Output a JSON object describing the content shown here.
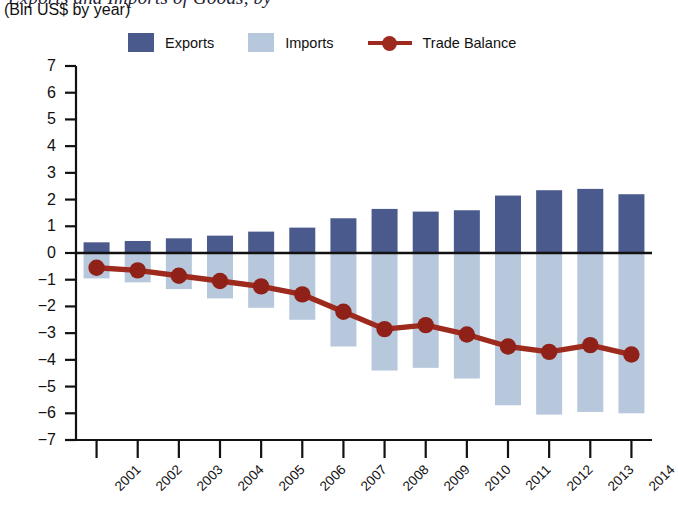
{
  "title": {
    "main_clipped": "Exports and Imports of Goods, by",
    "subtitle": "(Bln US$ by year)"
  },
  "legend": [
    {
      "label": "Exports",
      "color": "#4a5a8c",
      "marker": "square-swatch"
    },
    {
      "label": "Imports",
      "color": "#b8c8dc",
      "marker": "square-swatch"
    },
    {
      "label": "Trade Balance",
      "color": "#9e2a1e",
      "marker": "line-with-dot"
    }
  ],
  "chart_data": {
    "type": "bar",
    "title": "Exports and Imports of Goods, by",
    "subtitle": "(Bln US$ by year)",
    "xlabel": "",
    "ylabel": "",
    "ylim": [
      -7,
      7
    ],
    "yticks": [
      7,
      6,
      5,
      4,
      3,
      2,
      1,
      0,
      -1,
      -2,
      -3,
      -4,
      -5,
      -6,
      -7
    ],
    "ytick_labels": [
      "7",
      "6",
      "5",
      "4",
      "3",
      "2",
      "1",
      "0",
      "−1",
      "−2",
      "−3",
      "−4",
      "−5",
      "−6",
      "−7"
    ],
    "grid": false,
    "legend_position": "top",
    "categories": [
      "2001",
      "2002",
      "2003",
      "2004",
      "2005",
      "2006",
      "2007",
      "2008",
      "2009",
      "2010",
      "2011",
      "2012",
      "2013",
      "2014"
    ],
    "series": [
      {
        "name": "Exports",
        "type": "bar",
        "color": "#4a5a8c",
        "values": [
          0.4,
          0.45,
          0.55,
          0.65,
          0.8,
          0.95,
          1.3,
          1.65,
          1.55,
          1.6,
          2.15,
          2.35,
          2.4,
          2.2
        ]
      },
      {
        "name": "Imports",
        "type": "bar",
        "color": "#b8c8dc",
        "values": [
          -0.95,
          -1.1,
          -1.35,
          -1.7,
          -2.05,
          -2.5,
          -3.5,
          -4.4,
          -4.3,
          -4.7,
          -5.7,
          -6.05,
          -5.95,
          -6.0
        ]
      },
      {
        "name": "Trade Balance",
        "type": "line",
        "color": "#9e2a1e",
        "values": [
          -0.55,
          -0.65,
          -0.85,
          -1.05,
          -1.25,
          -1.55,
          -2.2,
          -2.85,
          -2.7,
          -3.05,
          -3.5,
          -3.7,
          -3.45,
          -3.8
        ]
      }
    ]
  }
}
